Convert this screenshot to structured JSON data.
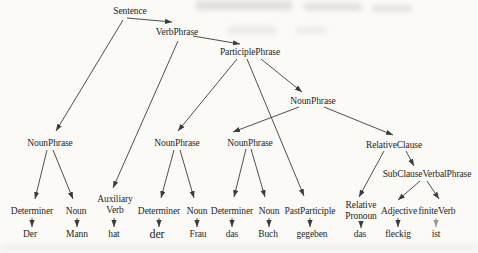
{
  "colors": {
    "bg": "#fbfaf7",
    "line": "#3b3b3b",
    "line_light": "#999999",
    "text": "#1e1e1e"
  },
  "tree": {
    "nodes": [
      {
        "id": "sentence",
        "lines": [
          "Sentence"
        ],
        "x": 130,
        "y": 6
      },
      {
        "id": "verbphrase",
        "lines": [
          "VerbPhrase"
        ],
        "x": 177,
        "y": 27
      },
      {
        "id": "participlephrase",
        "lines": [
          "ParticiplePhrase"
        ],
        "x": 250,
        "y": 47
      },
      {
        "id": "nounphrase-object",
        "lines": [
          "NounPhrase"
        ],
        "x": 313,
        "y": 96
      },
      {
        "id": "nounphrase-subject",
        "lines": [
          "NounPhrase"
        ],
        "x": 50,
        "y": 138
      },
      {
        "id": "nounphrase-dative",
        "lines": [
          "NounPhrase"
        ],
        "x": 177,
        "y": 138
      },
      {
        "id": "nounphrase-accusative",
        "lines": [
          "NounPhrase"
        ],
        "x": 250,
        "y": 138
      },
      {
        "id": "relativeclause",
        "lines": [
          "RelativeClause"
        ],
        "x": 394,
        "y": 140
      },
      {
        "id": "subclauseverbalphrase",
        "lines": [
          "SubClauseVerbalPhrase"
        ],
        "x": 427,
        "y": 169
      },
      {
        "id": "auxiliary-verb",
        "lines": [
          "Auxiliary",
          "Verb"
        ],
        "x": 115,
        "y": 194
      },
      {
        "id": "relative-pronoun",
        "lines": [
          "Relative",
          "Pronoun"
        ],
        "x": 361,
        "y": 200
      },
      {
        "id": "determiner-1",
        "lines": [
          "Determiner"
        ],
        "x": 32,
        "y": 206
      },
      {
        "id": "noun-1",
        "lines": [
          "Noun"
        ],
        "x": 76,
        "y": 206
      },
      {
        "id": "determiner-2",
        "lines": [
          "Determiner"
        ],
        "x": 159,
        "y": 206
      },
      {
        "id": "noun-2",
        "lines": [
          "Noun"
        ],
        "x": 197,
        "y": 206
      },
      {
        "id": "determiner-3",
        "lines": [
          "Determiner"
        ],
        "x": 232,
        "y": 206
      },
      {
        "id": "noun-3",
        "lines": [
          "Noun"
        ],
        "x": 269,
        "y": 206
      },
      {
        "id": "pastparticiple",
        "lines": [
          "PastParticiple"
        ],
        "x": 310,
        "y": 206
      },
      {
        "id": "adjective",
        "lines": [
          "Adjective"
        ],
        "x": 399,
        "y": 206
      },
      {
        "id": "finiteverb",
        "lines": [
          "finiteVerb"
        ],
        "x": 437,
        "y": 206
      },
      {
        "id": "word-der-1",
        "lines": [
          "Der"
        ],
        "x": 30,
        "y": 229
      },
      {
        "id": "word-mann",
        "lines": [
          "Mann"
        ],
        "x": 77,
        "y": 229
      },
      {
        "id": "word-hat",
        "lines": [
          "hat"
        ],
        "x": 114,
        "y": 229
      },
      {
        "id": "word-der-2",
        "lines": [
          "der"
        ],
        "x": 157,
        "y": 228,
        "size": 12
      },
      {
        "id": "word-frau",
        "lines": [
          "Frau"
        ],
        "x": 198,
        "y": 229
      },
      {
        "id": "word-das-1",
        "lines": [
          "das"
        ],
        "x": 232,
        "y": 229
      },
      {
        "id": "word-buch",
        "lines": [
          "Buch"
        ],
        "x": 268,
        "y": 229
      },
      {
        "id": "word-gegeben",
        "lines": [
          "gegeben"
        ],
        "x": 312,
        "y": 229
      },
      {
        "id": "word-das-2",
        "lines": [
          "das"
        ],
        "x": 360,
        "y": 229
      },
      {
        "id": "word-fleckig",
        "lines": [
          "fleckig"
        ],
        "x": 398,
        "y": 229
      },
      {
        "id": "word-ist",
        "lines": [
          "ist"
        ],
        "x": 436,
        "y": 229
      }
    ],
    "edges": [
      {
        "from": "sentence",
        "to": "verbphrase",
        "p": [
          127,
          18,
          172,
          22
        ]
      },
      {
        "from": "sentence",
        "to": "nounphrase-subject",
        "p": [
          123,
          20,
          56,
          131
        ]
      },
      {
        "from": "verbphrase",
        "to": "participlephrase",
        "p": [
          193,
          36,
          240,
          44
        ]
      },
      {
        "from": "verbphrase",
        "to": "auxiliary-verb",
        "p": [
          178,
          41,
          113,
          188
        ]
      },
      {
        "from": "participlephrase",
        "to": "nounphrase-dative",
        "p": [
          237,
          59,
          178,
          131
        ]
      },
      {
        "from": "participlephrase",
        "to": "pastparticiple",
        "p": [
          247,
          59,
          304,
          196
        ]
      },
      {
        "from": "participlephrase",
        "to": "nounphrase-object",
        "p": [
          261,
          59,
          302,
          92
        ]
      },
      {
        "from": "nounphrase-object",
        "to": "nounphrase-accusative",
        "p": [
          299,
          107,
          233,
          132
        ]
      },
      {
        "from": "nounphrase-object",
        "to": "relativeclause",
        "p": [
          324,
          107,
          393,
          135
        ]
      },
      {
        "from": "relativeclause",
        "to": "relative-pronoun",
        "p": [
          384,
          151,
          359,
          197
        ]
      },
      {
        "from": "relativeclause",
        "to": "subclauseverbalphrase",
        "p": [
          406,
          151,
          414,
          166
        ]
      },
      {
        "from": "subclauseverbalphrase",
        "to": "adjective",
        "p": [
          420,
          181,
          398,
          200
        ]
      },
      {
        "from": "subclauseverbalphrase",
        "to": "finiteverb",
        "p": [
          427,
          181,
          439,
          199
        ]
      },
      {
        "from": "nounphrase-subject",
        "to": "determiner-1",
        "p": [
          47,
          150,
          35,
          199
        ]
      },
      {
        "from": "nounphrase-subject",
        "to": "noun-1",
        "p": [
          53,
          150,
          73,
          199
        ]
      },
      {
        "from": "nounphrase-dative",
        "to": "determiner-2",
        "p": [
          174,
          150,
          161,
          198
        ]
      },
      {
        "from": "nounphrase-dative",
        "to": "noun-2",
        "p": [
          180,
          150,
          194,
          198
        ]
      },
      {
        "from": "nounphrase-accusative",
        "to": "determiner-3",
        "p": [
          246,
          149,
          234,
          197
        ]
      },
      {
        "from": "nounphrase-accusative",
        "to": "noun-3",
        "p": [
          251,
          149,
          265,
          197
        ]
      },
      {
        "from": "determiner-1",
        "to": "word-der-1",
        "p": [
          32,
          218,
          32,
          227
        ]
      },
      {
        "from": "noun-1",
        "to": "word-mann",
        "p": [
          77,
          218,
          77,
          227
        ]
      },
      {
        "from": "auxiliary-verb",
        "to": "word-hat",
        "p": [
          114,
          218,
          114,
          227
        ]
      },
      {
        "from": "determiner-2",
        "to": "word-der-2",
        "p": [
          159,
          218,
          159,
          227
        ]
      },
      {
        "from": "noun-2",
        "to": "word-frau",
        "p": [
          197,
          218,
          197,
          227
        ]
      },
      {
        "from": "determiner-3",
        "to": "word-das-1",
        "p": [
          232,
          218,
          232,
          227
        ]
      },
      {
        "from": "noun-3",
        "to": "word-buch",
        "p": [
          269,
          218,
          269,
          227
        ]
      },
      {
        "from": "pastparticiple",
        "to": "word-gegeben",
        "p": [
          310,
          218,
          310,
          227
        ]
      },
      {
        "from": "relative-pronoun",
        "to": "word-das-2",
        "p": [
          361,
          223,
          361,
          228
        ]
      },
      {
        "from": "adjective",
        "to": "word-fleckig",
        "p": [
          398,
          218,
          398,
          227
        ]
      },
      {
        "from": "finiteverb",
        "to": "word-ist",
        "p": [
          436,
          218,
          436,
          227
        ],
        "light": true
      }
    ]
  }
}
